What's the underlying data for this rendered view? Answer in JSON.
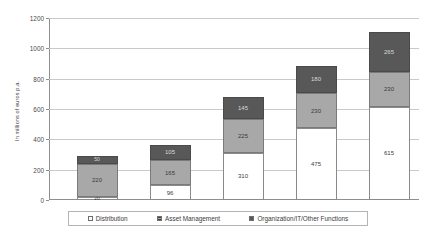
{
  "chart_data": {
    "type": "bar",
    "subtype": "stacked-bar",
    "title": "",
    "xlabel": "",
    "ylabel": "In millions of euros p.a.",
    "ylim": [
      0,
      1200
    ],
    "yticks": [
      0,
      200,
      400,
      600,
      800,
      1000,
      1200
    ],
    "ytick_labels": [
      "0",
      "200",
      "400",
      "600",
      "800",
      "1000",
      "1200"
    ],
    "grid": true,
    "legend_position": "bottom",
    "categories": [
      "1",
      "2",
      "3",
      "4",
      "5"
    ],
    "xtick_labels": [
      "",
      "",
      "",
      "",
      ""
    ],
    "series": [
      {
        "name": "Distribution",
        "color": "#ffffff",
        "values": [
          20,
          96,
          310,
          475,
          615
        ]
      },
      {
        "name": "Asset Management",
        "color": "#a8a8a8",
        "values": [
          220,
          165,
          225,
          230,
          230
        ]
      },
      {
        "name": "Organization/IT/Other Functions",
        "color": "#585858",
        "values": [
          50,
          105,
          145,
          180,
          265
        ]
      }
    ],
    "totals": [
      290,
      366,
      680,
      885,
      1110
    ]
  },
  "legend": {
    "items": [
      {
        "label": "Distribution",
        "swatch": "distribution"
      },
      {
        "label": "Asset Management",
        "swatch": "asset"
      },
      {
        "label": "Organization/IT/Other Functions",
        "swatch": "org"
      }
    ]
  }
}
